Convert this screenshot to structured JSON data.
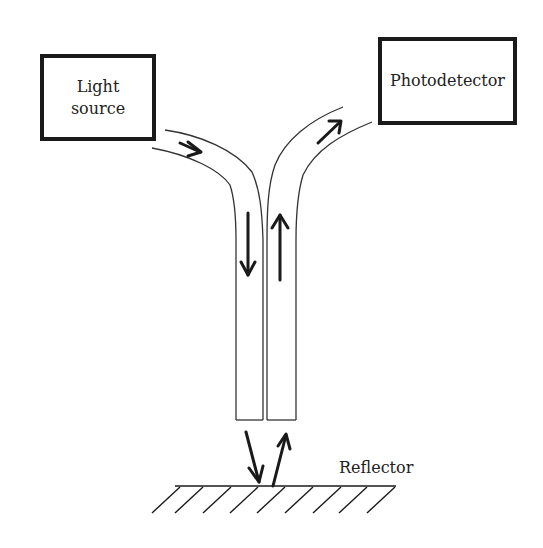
{
  "diagram": {
    "nodes": {
      "light_source": {
        "label": "Light\nsource"
      },
      "photodetector": {
        "label": "Photodetector"
      },
      "reflector": {
        "label": "Reflector"
      }
    },
    "arrows": [
      {
        "name": "incoming-light",
        "location": "source fiber bend",
        "direction": "toward fiber"
      },
      {
        "name": "down-light",
        "location": "left vertical fiber",
        "direction": "down"
      },
      {
        "name": "emitted-light",
        "location": "below left fiber",
        "direction": "down to reflector"
      },
      {
        "name": "reflected-light",
        "location": "below right fiber",
        "direction": "up from reflector"
      },
      {
        "name": "up-light",
        "location": "right vertical fiber",
        "direction": "up"
      },
      {
        "name": "outgoing-light",
        "location": "detector fiber bend",
        "direction": "toward photodetector"
      }
    ],
    "colors": {
      "stroke": "#1a1a1a",
      "text": "#222222",
      "background": "#ffffff"
    }
  }
}
